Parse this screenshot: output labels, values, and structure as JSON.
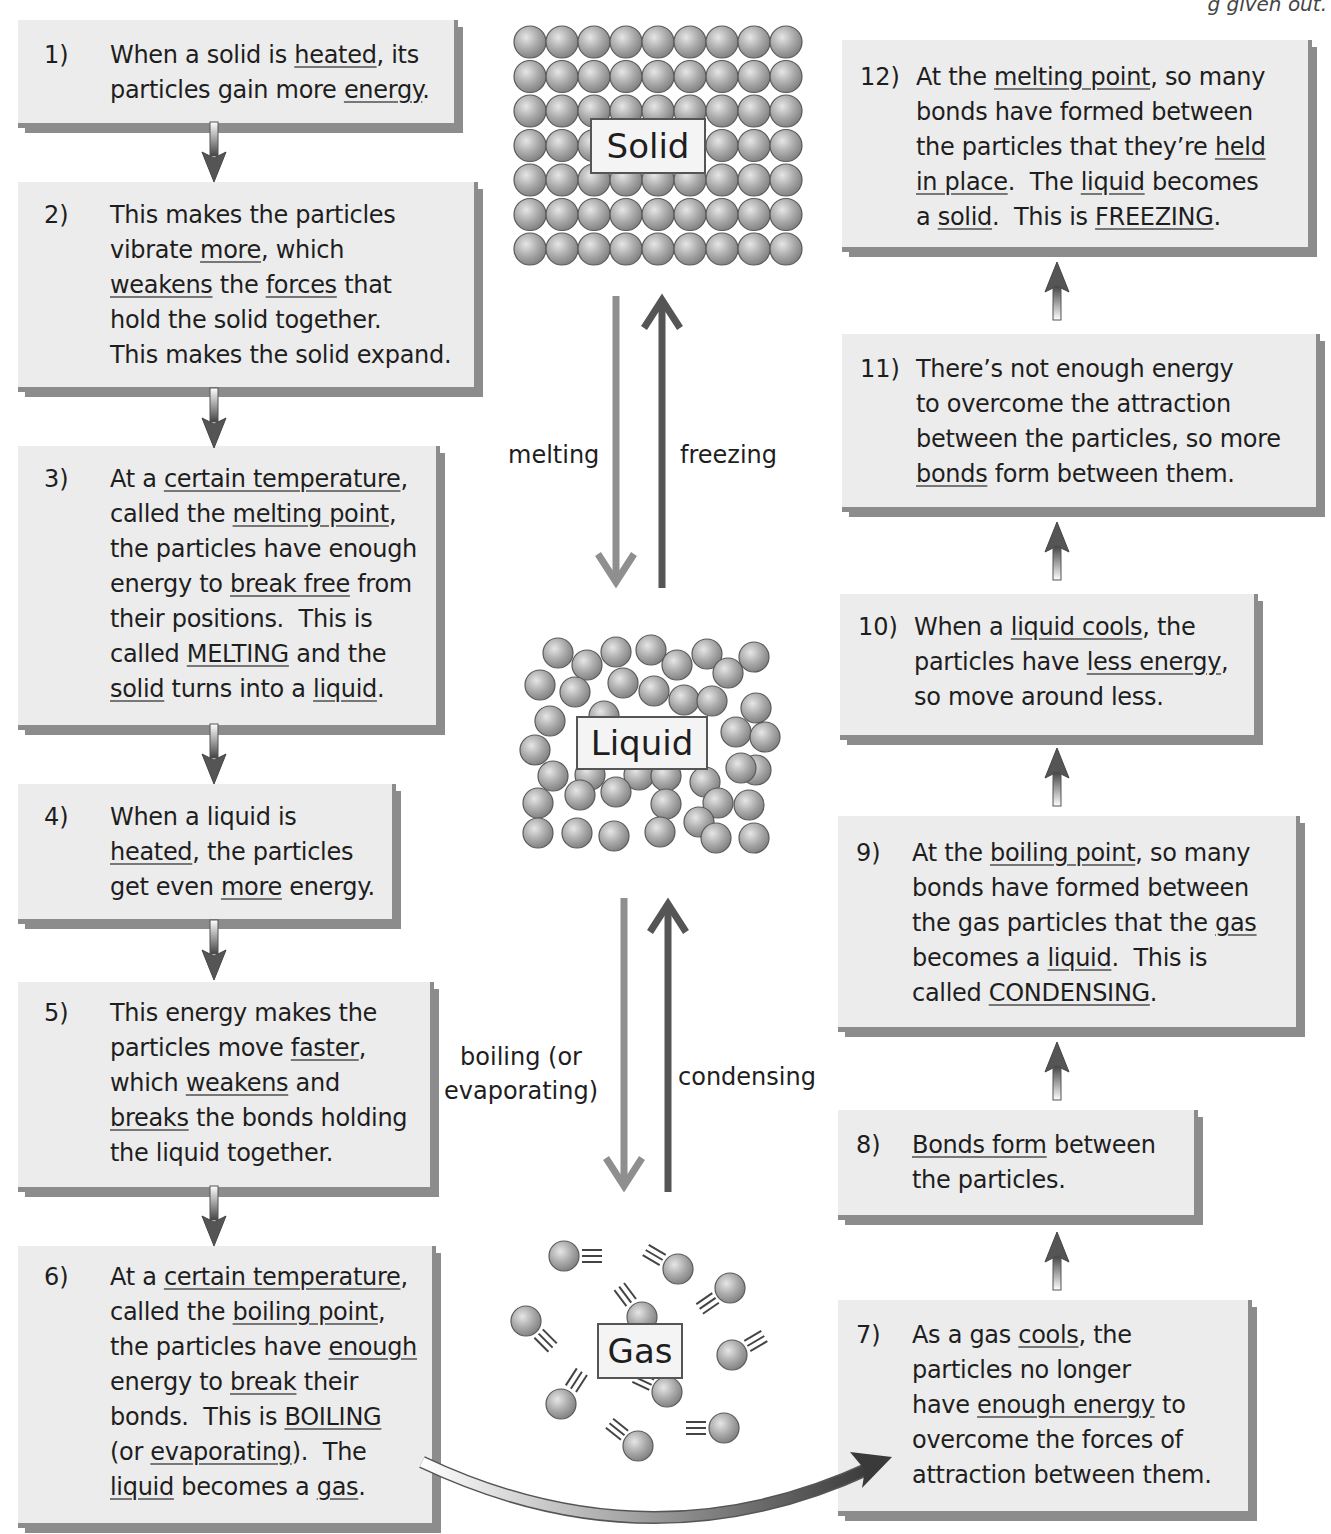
{
  "corner_text": "g given out.",
  "states": {
    "solid": "Solid",
    "liquid": "Liquid",
    "gas": "Gas"
  },
  "transitions": {
    "melting": "melting",
    "freezing": "freezing",
    "boiling_line1": "boiling (or",
    "boiling_line2": "evaporating)",
    "condensing": "condensing"
  },
  "colors": {
    "box_bg": "#ececec",
    "box_shadow": "#8c8c8c",
    "particle": "#a8a8a8",
    "down_arrow": "#909090",
    "up_arrow": "#555555"
  },
  "steps": [
    {
      "num": "1)",
      "html": "When a solid is <u>heated</u>, its<br>particles gain more <u>energy</u>."
    },
    {
      "num": "2)",
      "html": "This makes the particles<br>vibrate <u>more</u>, which<br><u>weakens</u> the <u>forces</u> that<br>hold the solid together.<br>This makes the solid expand."
    },
    {
      "num": "3)",
      "html": "At a <u>certain temperature</u>,<br>called the <u>melting point</u>,<br>the particles have enough<br>energy to <u>break free</u> from<br>their positions.&nbsp; This is<br>called <u>MELTING</u> and the<br><u>solid</u> turns into a <u>liquid</u>."
    },
    {
      "num": "4)",
      "html": "When a liquid is<br><u>heated</u>, the particles<br>get even <u>more</u> energy."
    },
    {
      "num": "5)",
      "html": "This energy makes the<br>particles move <u>faster</u>,<br>which <u>weakens</u> and<br><u>breaks</u> the bonds holding<br>the liquid together."
    },
    {
      "num": "6)",
      "html": "At a <u>certain temperature</u>,<br>called the <u>boiling point</u>,<br>the particles have <u>enough</u><br>energy to <u>break</u> their<br>bonds.&nbsp; This is <u>BOILING</u><br>(or <u>evaporating</u>).&nbsp; The<br><u>liquid</u> becomes a <u>gas</u>."
    },
    {
      "num": "7)",
      "html": "As a gas <u>cools</u>, the<br>particles no longer<br>have <u>enough energy</u> to<br>overcome the forces of<br>attraction between them."
    },
    {
      "num": "8)",
      "html": "<u>Bonds form</u> between<br>the particles."
    },
    {
      "num": "9)",
      "html": "At the <u>boiling point</u>, so many<br>bonds have formed between<br>the gas particles that the <u>gas</u><br>becomes a <u>liquid</u>.&nbsp; This is<br>called <u>CONDENSING</u>."
    },
    {
      "num": "10)",
      "html": "When a <u>liquid cools</u>, the<br>particles have <u>less energy</u>,<br>so move around less."
    },
    {
      "num": "11)",
      "html": "There’s not enough energy<br>to overcome the attraction<br>between the particles, so more<br><u>bonds</u> form between them."
    },
    {
      "num": "12)",
      "html": "At the <u>melting point</u>, so many<br>bonds have formed between<br>the particles that they’re <u>held<br>in place</u>.&nbsp; The <u>liquid</u> becomes<br>a <u>solid</u>.&nbsp; This is <u>FREEZING</u>."
    }
  ]
}
